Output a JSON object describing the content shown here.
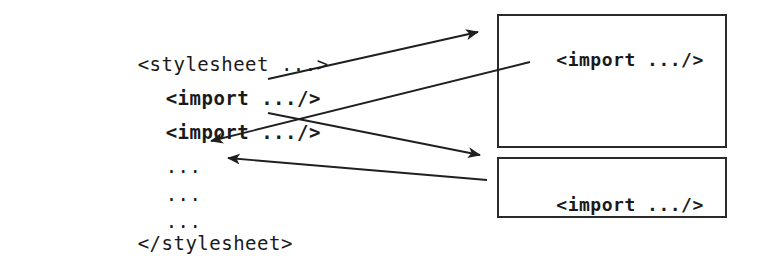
{
  "diagram": {
    "stroke_color": "#2a2a2a",
    "text_color": "#1a1a1a",
    "background_color": "#ffffff"
  },
  "source": {
    "lines": [
      {
        "id": "open-tag",
        "text": "<stylesheet ...>",
        "bold": false,
        "indent": 0
      },
      {
        "id": "import-1",
        "text": "<import .../>",
        "bold": true,
        "indent": 1
      },
      {
        "id": "import-2",
        "text": "<import .../>",
        "bold": true,
        "indent": 1
      },
      {
        "id": "ellipsis-1",
        "text": "...",
        "bold": false,
        "indent": 1
      },
      {
        "id": "ellipsis-2",
        "text": "...",
        "bold": false,
        "indent": 1
      },
      {
        "id": "ellipsis-3",
        "text": "...",
        "bold": false,
        "indent": 1
      },
      {
        "id": "close-tag",
        "text": "</stylesheet>",
        "bold": false,
        "indent": 0
      }
    ]
  },
  "targets": {
    "boxes": [
      {
        "id": "imported-sheet-1",
        "label": "<import .../>"
      },
      {
        "id": "imported-sheet-2",
        "label": "<import .../>"
      }
    ]
  },
  "connections": [
    {
      "id": "out-1",
      "from": "import-1",
      "to": "imported-sheet-1",
      "direction": "right"
    },
    {
      "id": "back-1",
      "from": "imported-sheet-1",
      "to": "ellipsis-1",
      "direction": "left"
    },
    {
      "id": "out-2",
      "from": "import-2",
      "to": "imported-sheet-2",
      "direction": "right"
    },
    {
      "id": "back-2",
      "from": "imported-sheet-2",
      "to": "ellipsis-2",
      "direction": "left"
    }
  ]
}
